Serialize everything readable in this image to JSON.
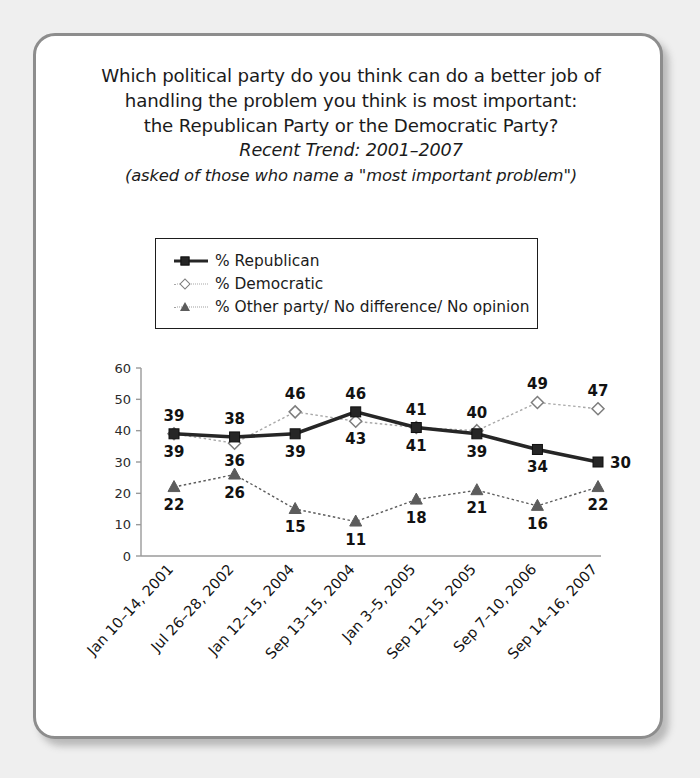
{
  "card": {
    "title_lines": [
      "Which political party do you think can do a better job of",
      "handling the problem you think is most important:",
      "the Republican Party or the Democratic Party?"
    ],
    "trend_line": "Recent Trend: 2001–2007",
    "note_line": "(asked of those who name a \"most important problem\")"
  },
  "legend": {
    "items": [
      {
        "label": "% Republican",
        "marker": "filled-square",
        "color": "#262626"
      },
      {
        "label": "% Democratic",
        "marker": "open-diamond",
        "color": "#a8a8a8"
      },
      {
        "label": "% Other party/ No difference/ No opinion",
        "marker": "filled-triangle",
        "color": "#5c5c5c"
      }
    ]
  },
  "chart_data": {
    "type": "line",
    "title": "Which political party do you think can do a better job of handling the problem you think is most important: the Republican Party or the Democratic Party?",
    "subtitle": "Recent Trend: 2001–2007",
    "annotation": "(asked of those who name a \"most important problem\")",
    "xlabel": "",
    "ylabel": "",
    "ylim": [
      0,
      60
    ],
    "yticks": [
      0,
      10,
      20,
      30,
      40,
      50,
      60
    ],
    "grid": false,
    "legend_position": "above-plot",
    "categories": [
      "Jan 10–14, 2001",
      "Jul 26–28, 2002",
      "Jan 12–15, 2004",
      "Sep 13–15, 2004",
      "Jan 3–5, 2005",
      "Sep 12–15, 2005",
      "Sep 7–10, 2006",
      "Sep 14–16, 2007"
    ],
    "series": [
      {
        "name": "% Republican",
        "color": "#262626",
        "marker": "filled-square",
        "values": [
          39,
          38,
          39,
          46,
          41,
          39,
          34,
          30
        ],
        "label_positions": [
          "above",
          "above",
          "below",
          "above",
          "above",
          "below",
          "below",
          "right"
        ]
      },
      {
        "name": "% Democratic",
        "color": "#a8a8a8",
        "marker": "open-diamond",
        "values": [
          39,
          36,
          46,
          43,
          41,
          40,
          49,
          47
        ],
        "label_positions": [
          "below",
          "below",
          "above",
          "below",
          "below",
          "above",
          "above",
          "above"
        ]
      },
      {
        "name": "% Other party/ No difference/ No opinion",
        "color": "#5c5c5c",
        "marker": "filled-triangle",
        "values": [
          22,
          26,
          15,
          11,
          18,
          21,
          16,
          22
        ],
        "label_positions": [
          "below",
          "below",
          "below",
          "below",
          "below",
          "below",
          "below",
          "below"
        ]
      }
    ]
  }
}
